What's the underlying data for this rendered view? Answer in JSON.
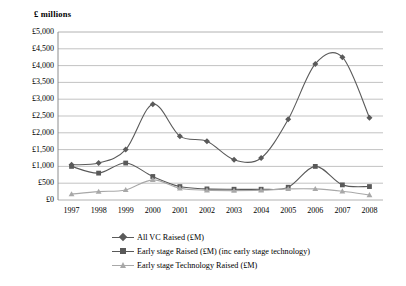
{
  "chart_data": {
    "type": "line",
    "title": "",
    "subtitle": "",
    "ylabel": "£ millions",
    "xlabel": "",
    "categories": [
      "1997",
      "1998",
      "1999",
      "2000",
      "2001",
      "2002",
      "2003",
      "2004",
      "2005",
      "2006",
      "2007",
      "2008"
    ],
    "ylim": [
      0,
      5000
    ],
    "ytick_step": 500,
    "ytick_labels": [
      "£5,000",
      "£4,500",
      "£4,000",
      "£3,500",
      "£3,000",
      "£2,500",
      "£2,000",
      "£1,500",
      "£1,000",
      "£500",
      "£0"
    ],
    "ytick_values": [
      5000,
      4500,
      4000,
      3500,
      3000,
      2500,
      2000,
      1500,
      1000,
      500,
      0
    ],
    "grid": true,
    "grid_axis": "y",
    "legend_position": "bottom",
    "series": [
      {
        "name": "All VC Raised (£M)",
        "marker": "diamond",
        "color": "#5a5a5a",
        "values": [
          1050,
          1100,
          1500,
          2850,
          1900,
          1750,
          1200,
          1250,
          2400,
          4050,
          4250,
          2450
        ]
      },
      {
        "name": "Early stage Raised (£M) (inc early stage technology)",
        "marker": "square",
        "color": "#595959",
        "values": [
          1000,
          800,
          1100,
          700,
          400,
          330,
          320,
          320,
          380,
          1000,
          450,
          400
        ]
      },
      {
        "name": "Early stage Technology Raised (£M)",
        "marker": "triangle",
        "color": "#a8a8a8",
        "values": [
          175,
          250,
          300,
          600,
          350,
          290,
          280,
          290,
          330,
          330,
          260,
          150
        ]
      }
    ]
  },
  "plot": {
    "x_left": 58,
    "x_right": 383,
    "y_top": 32,
    "y_bottom": 200,
    "grid_color": "#a9a9a9",
    "axis_color": "#7f7f7f",
    "background": "#ffffff"
  }
}
